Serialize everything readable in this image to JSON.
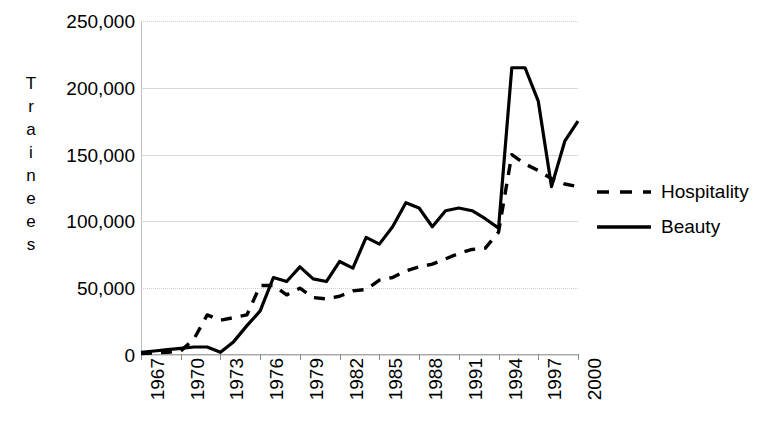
{
  "chart_data": {
    "type": "line",
    "title": "",
    "xlabel": "",
    "ylabel": "Trainees",
    "ylabel_letters": [
      "T",
      "r",
      "a",
      "i",
      "n",
      "e",
      "e",
      "s"
    ],
    "xlim": [
      1967,
      2000
    ],
    "ylim": [
      0,
      250000
    ],
    "grid": true,
    "legend_position": "right",
    "ytick_labels": [
      "250,000",
      "200,000",
      "150,000",
      "100,000",
      "50,000",
      "0"
    ],
    "ytick_values": [
      250000,
      200000,
      150000,
      100000,
      50000,
      0
    ],
    "xtick_labels": [
      "1967",
      "1970",
      "1973",
      "1976",
      "1979",
      "1982",
      "1985",
      "1988",
      "1991",
      "1994",
      "1997",
      "2000"
    ],
    "xtick_values": [
      1967,
      1970,
      1973,
      1976,
      1979,
      1982,
      1985,
      1988,
      1991,
      1994,
      1997,
      2000
    ],
    "x": [
      1967,
      1968,
      1969,
      1970,
      1971,
      1972,
      1973,
      1974,
      1975,
      1976,
      1977,
      1978,
      1979,
      1980,
      1981,
      1982,
      1983,
      1984,
      1985,
      1986,
      1987,
      1988,
      1989,
      1990,
      1991,
      1992,
      1993,
      1994,
      1995,
      1996,
      1997,
      1998,
      1999,
      2000
    ],
    "series": [
      {
        "name": "Beauty",
        "style": "solid",
        "color": "#000000",
        "values": [
          2000,
          3000,
          4000,
          5000,
          6000,
          6000,
          2000,
          10000,
          22000,
          33000,
          58000,
          55000,
          66000,
          57000,
          55000,
          70000,
          65000,
          88000,
          83000,
          96000,
          114000,
          110000,
          96000,
          108000,
          110000,
          108000,
          102000,
          95000,
          215000,
          215000,
          190000,
          126000,
          160000,
          175000
        ]
      },
      {
        "name": "Hospitality",
        "style": "dashed",
        "color": "#000000",
        "values": [
          1000,
          1500,
          2000,
          3000,
          12000,
          30000,
          26000,
          28000,
          30000,
          52000,
          52000,
          45000,
          50000,
          43000,
          42000,
          44000,
          48000,
          49000,
          56000,
          58000,
          63000,
          66000,
          68000,
          72000,
          76000,
          79000,
          80000,
          92000,
          150000,
          143000,
          138000,
          132000,
          128000,
          126000
        ]
      }
    ]
  },
  "legend": {
    "items": [
      {
        "label": "Hospitality",
        "style": "dashed"
      },
      {
        "label": "Beauty",
        "style": "solid"
      }
    ]
  }
}
